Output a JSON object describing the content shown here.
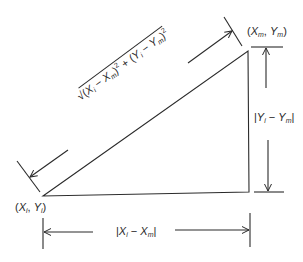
{
  "diagram": {
    "type": "right-triangle-distance",
    "stroke_color": "#2a2a2a",
    "background": "#ffffff",
    "points": {
      "start": {
        "label": "(X_i, Y_i)",
        "x_sym": "X",
        "x_sub": "i",
        "y_sym": "Y",
        "y_sub": "i"
      },
      "end": {
        "label": "(X_m, Y_m)",
        "x_sym": "X",
        "x_sub": "m",
        "y_sym": "Y",
        "y_sub": "m"
      }
    },
    "dimensions": {
      "hypotenuse": {
        "label": "√((X_i − X_m)² + (Y_i − Y_m)²)",
        "radical": "√",
        "open": "(",
        "x": "X",
        "xi": "i",
        "minus": " − ",
        "xm": "m",
        "close": ")",
        "sq": "2",
        "plus": " + "
      },
      "vertical": {
        "label": "|Y_i − Y_m|",
        "bar": "|",
        "sym": "Y",
        "sub_i": "i",
        "minus": " − ",
        "sub_m": "m"
      },
      "horizontal": {
        "label": "|X_i − X_m|",
        "bar": "|",
        "sym": "X",
        "sub_i": "i",
        "minus": " − ",
        "sub_m": "m"
      }
    }
  }
}
